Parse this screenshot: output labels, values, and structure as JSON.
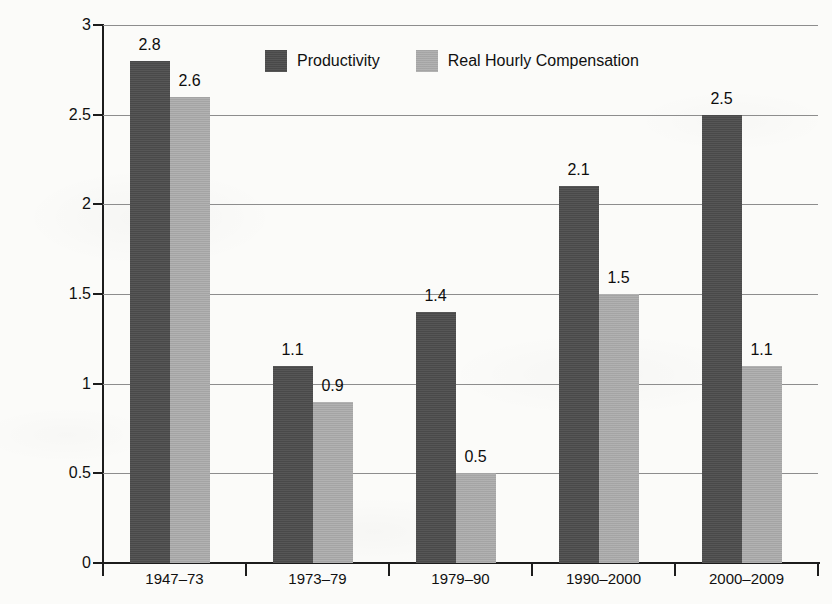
{
  "chart_data": {
    "type": "bar",
    "title": "",
    "xlabel": "",
    "ylabel": "Average annual percent change",
    "categories": [
      "1947–73",
      "1973–79",
      "1979–90",
      "1990–2000",
      "2000–2009"
    ],
    "series": [
      {
        "name": "Productivity",
        "color": "#4d4d4d",
        "values": [
          2.8,
          1.1,
          1.4,
          2.1,
          2.5
        ],
        "labels": [
          "2.8",
          "1.1",
          "1.4",
          "2.1",
          "2.5"
        ]
      },
      {
        "name": "Real Hourly Compensation",
        "color": "#ababab",
        "values": [
          2.6,
          0.9,
          0.5,
          1.5,
          1.1
        ],
        "labels": [
          "2.6",
          "0.9",
          "0.5",
          "1.5",
          "1.1"
        ]
      }
    ],
    "ylim": [
      0,
      3
    ],
    "yticks": [
      0,
      0.5,
      1,
      1.5,
      2,
      2.5,
      3
    ],
    "ytick_labels": [
      "0",
      "0.5",
      "1",
      "1.5",
      "2",
      "2.5",
      "3"
    ],
    "grid": "horizontal",
    "legend_position": "top-center",
    "background_color": "#fbfbf9",
    "axis_color": "#1c1c1c",
    "grid_color": "#8d8d8d"
  },
  "legend": {
    "items": [
      {
        "label": "Productivity",
        "swatch": "productivity"
      },
      {
        "label": "Real Hourly Compensation",
        "swatch": "compensation"
      }
    ]
  }
}
